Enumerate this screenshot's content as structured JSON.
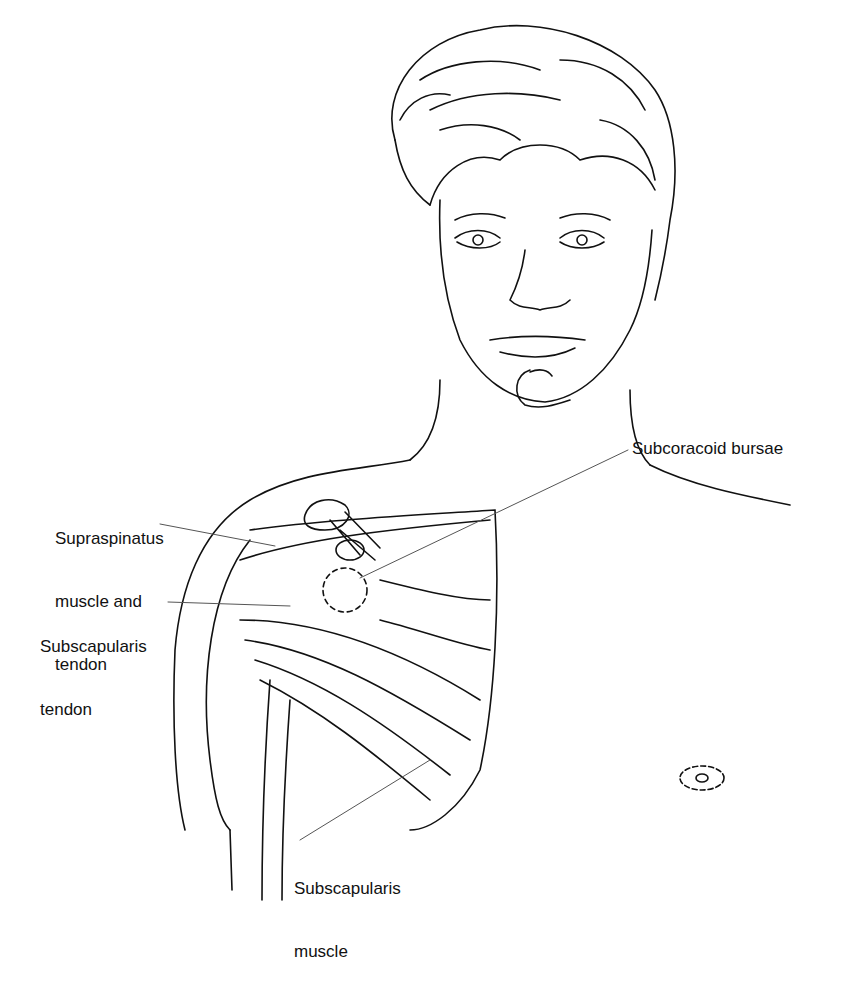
{
  "diagram": {
    "labels": {
      "subcoracoid": "Subcoracoid bursae",
      "supraspinatus_1": "Supraspinatus",
      "supraspinatus_2": "muscle and",
      "supraspinatus_3": "tendon",
      "subscap_tendon_1": "Subscapularis",
      "subscap_tendon_2": "tendon",
      "subscap_muscle_1": "Subscapularis",
      "subscap_muscle_2": "muscle"
    }
  }
}
